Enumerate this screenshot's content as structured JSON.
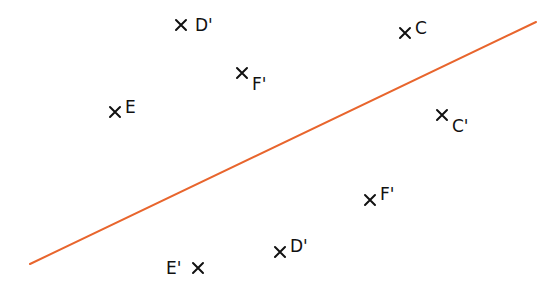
{
  "diagram": {
    "type": "reflection",
    "mirror_line": {
      "color": "#E8652D",
      "stroke_width": 2,
      "x1": 30,
      "y1": 264,
      "x2": 536,
      "y2": 22
    },
    "point_marker": "×",
    "points": [
      {
        "id": "d-prime-top",
        "label": "D'",
        "x": 181,
        "y": 25,
        "label_dx": 14,
        "label_dy": 0,
        "label_side": "right"
      },
      {
        "id": "c",
        "label": "C",
        "x": 405,
        "y": 33,
        "label_dx": 10,
        "label_dy": -5,
        "label_side": "right"
      },
      {
        "id": "f-prime-upper",
        "label": "F'",
        "x": 242,
        "y": 73,
        "label_dx": 10,
        "label_dy": 11,
        "label_side": "right"
      },
      {
        "id": "e",
        "label": "E",
        "x": 115,
        "y": 112,
        "label_dx": 10,
        "label_dy": -5,
        "label_side": "right"
      },
      {
        "id": "c-prime",
        "label": "C'",
        "x": 442,
        "y": 115,
        "label_dx": 10,
        "label_dy": 11,
        "label_side": "right"
      },
      {
        "id": "f-prime-lower",
        "label": "F'",
        "x": 370,
        "y": 200,
        "label_dx": 10,
        "label_dy": -6,
        "label_side": "right"
      },
      {
        "id": "d-prime-lower",
        "label": "D'",
        "x": 280,
        "y": 252,
        "label_dx": 10,
        "label_dy": -6,
        "label_side": "right"
      },
      {
        "id": "e-prime",
        "label": "E'",
        "x": 198,
        "y": 268,
        "label_dx": -32,
        "label_dy": 0,
        "label_side": "left"
      }
    ]
  }
}
